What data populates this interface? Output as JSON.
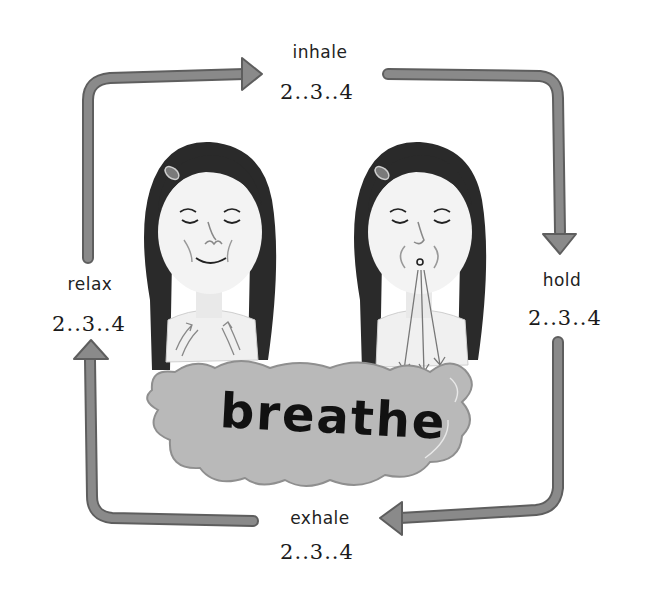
{
  "title": "breathe",
  "cycle": [
    {
      "id": "inhale",
      "label": "inhale",
      "count": "2..3..4"
    },
    {
      "id": "hold",
      "label": "hold",
      "count": "2..3..4"
    },
    {
      "id": "exhale",
      "label": "exhale",
      "count": "2..3..4"
    },
    {
      "id": "relax",
      "label": "relax",
      "count": "2..3..4"
    }
  ],
  "figures": [
    {
      "id": "girl-inhaling",
      "description": "girl with eyes closed, smiling, breathing in (arrows pointing up to chest)"
    },
    {
      "id": "girl-exhaling",
      "description": "girl with eyes closed, lips pursed, breathing out (arrows pointing down)"
    }
  ],
  "colors": {
    "arrow": "#8a8a8a",
    "arrow_edge": "#5e5e5e",
    "hair": "#2a2a2a",
    "skin": "#f2f2f2",
    "cloud": "#b9b9b9",
    "text": "#1a1a1a"
  }
}
